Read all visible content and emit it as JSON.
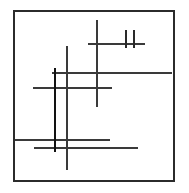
{
  "figure": {
    "canvas": {
      "width": 189,
      "height": 193,
      "background": "#ffffff"
    },
    "frame": {
      "name": "bounding-frame",
      "x": 14,
      "y": 11,
      "width": 160,
      "height": 170,
      "stroke": "#2b2b2b",
      "stroke_width": 1.2,
      "fill": "none"
    },
    "palette": {
      "ink_dark": "#1a1a1a",
      "ink_medium": "#3a3a3a",
      "ink_light": "#555555",
      "frame": "#2b2b2b",
      "background": "#ffffff"
    },
    "strokes": [
      {
        "name": "horizontal-line-upper-short",
        "orientation": "horizontal",
        "x1": 88,
        "y1": 44,
        "x2": 145,
        "y2": 44,
        "length": 57,
        "stroke": "#3a3a3a",
        "stroke_width": 1.6
      },
      {
        "name": "horizontal-line-long-right",
        "orientation": "horizontal",
        "x1": 52,
        "y1": 73,
        "x2": 172,
        "y2": 73,
        "length": 120,
        "stroke": "#3a3a3a",
        "stroke_width": 1.6
      },
      {
        "name": "horizontal-line-middle-left",
        "orientation": "horizontal",
        "x1": 33,
        "y1": 88,
        "x2": 112,
        "y2": 88,
        "length": 79,
        "stroke": "#3a3a3a",
        "stroke_width": 1.7
      },
      {
        "name": "horizontal-line-lower-upper",
        "orientation": "horizontal",
        "x1": 15,
        "y1": 140,
        "x2": 110,
        "y2": 140,
        "length": 95,
        "stroke": "#3a3a3a",
        "stroke_width": 1.5
      },
      {
        "name": "horizontal-line-lower-lower",
        "orientation": "horizontal",
        "x1": 34,
        "y1": 148,
        "x2": 138,
        "y2": 148,
        "length": 104,
        "stroke": "#3a3a3a",
        "stroke_width": 1.7
      },
      {
        "name": "vertical-line-heavy-left",
        "orientation": "vertical",
        "x1": 55,
        "y1": 68,
        "x2": 55,
        "y2": 152,
        "length": 84,
        "stroke": "#121212",
        "stroke_width": 2.4
      },
      {
        "name": "vertical-line-tall-center",
        "orientation": "vertical",
        "x1": 67,
        "y1": 46,
        "x2": 67,
        "y2": 170,
        "length": 124,
        "stroke": "#3a3a3a",
        "stroke_width": 1.5
      },
      {
        "name": "vertical-line-upper-center",
        "orientation": "vertical",
        "x1": 97,
        "y1": 20,
        "x2": 97,
        "y2": 107,
        "length": 87,
        "stroke": "#3a3a3a",
        "stroke_width": 1.6
      },
      {
        "name": "vertical-tick-left",
        "orientation": "vertical",
        "x1": 126,
        "y1": 30,
        "x2": 126,
        "y2": 48,
        "length": 18,
        "stroke": "#2a2a2a",
        "stroke_width": 1.8
      },
      {
        "name": "vertical-tick-right",
        "orientation": "vertical",
        "x1": 134,
        "y1": 30,
        "x2": 134,
        "y2": 48,
        "length": 18,
        "stroke": "#2a2a2a",
        "stroke_width": 1.8
      }
    ],
    "counts": {
      "total_strokes": 10,
      "horizontal_strokes": 5,
      "vertical_strokes": 5
    }
  }
}
